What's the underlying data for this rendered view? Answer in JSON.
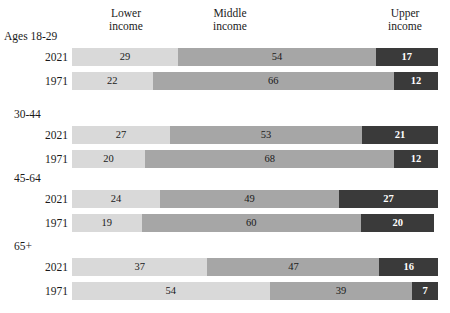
{
  "headers": {
    "lower": {
      "line1": "Lower",
      "line2": "income"
    },
    "middle": {
      "line1": "Middle",
      "line2": "income"
    },
    "upper": {
      "line1": "Upper",
      "line2": "income"
    }
  },
  "colors": {
    "lower": "#d9d9d9",
    "middle": "#a6a6a6",
    "upper": "#3a3a3a",
    "background": "#ffffff",
    "text": "#1a1a1a",
    "text_on_dark": "#ffffff"
  },
  "groups": [
    {
      "label": "Ages 18-29",
      "rows": [
        {
          "year": "2021",
          "lower": 29,
          "middle": 54,
          "upper": 17
        },
        {
          "year": "1971",
          "lower": 22,
          "middle": 66,
          "upper": 12
        }
      ]
    },
    {
      "label": "30-44",
      "rows": [
        {
          "year": "2021",
          "lower": 27,
          "middle": 53,
          "upper": 21
        },
        {
          "year": "1971",
          "lower": 20,
          "middle": 68,
          "upper": 12
        }
      ]
    },
    {
      "label": "45-64",
      "rows": [
        {
          "year": "2021",
          "lower": 24,
          "middle": 49,
          "upper": 27
        },
        {
          "year": "1971",
          "lower": 19,
          "middle": 60,
          "upper": 20
        }
      ]
    },
    {
      "label": "65+",
      "rows": [
        {
          "year": "2021",
          "lower": 37,
          "middle": 47,
          "upper": 16
        },
        {
          "year": "1971",
          "lower": 54,
          "middle": 39,
          "upper": 7
        }
      ]
    }
  ],
  "chart_data": {
    "type": "bar",
    "orientation": "horizontal",
    "stacked": true,
    "normalized_percent": true,
    "title": "",
    "xlabel": "",
    "ylabel": "",
    "xlim": [
      0,
      100
    ],
    "grid": false,
    "legend_position": "top",
    "legend": [
      "Lower income",
      "Middle income",
      "Upper income"
    ],
    "series": [
      {
        "name": "Lower income",
        "values": [
          29,
          22,
          27,
          20,
          24,
          19,
          37,
          54
        ]
      },
      {
        "name": "Middle income",
        "values": [
          54,
          66,
          53,
          68,
          49,
          60,
          47,
          39
        ]
      },
      {
        "name": "Upper income",
        "values": [
          17,
          12,
          21,
          12,
          27,
          20,
          16,
          7
        ]
      }
    ],
    "categories": [
      "Ages 18-29 / 2021",
      "Ages 18-29 / 1971",
      "30-44 / 2021",
      "30-44 / 1971",
      "45-64 / 2021",
      "45-64 / 1971",
      "65+ / 2021",
      "65+ / 1971"
    ],
    "group_labels": [
      "Ages 18-29",
      "30-44",
      "45-64",
      "65+"
    ],
    "row_labels": [
      "2021",
      "1971"
    ]
  },
  "layout": {
    "group_tops": [
      30,
      108,
      172,
      240
    ],
    "row_offsets": [
      18,
      42
    ],
    "bar_left": 72,
    "bar_width": 366
  }
}
